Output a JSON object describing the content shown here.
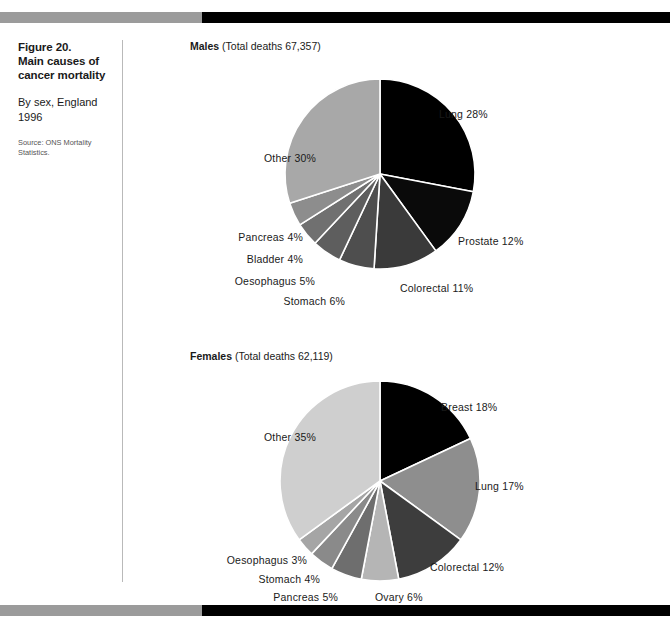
{
  "figure": {
    "title": "Figure 20.\nMain causes of\ncancer mortality",
    "title_line1": "Figure 20.",
    "title_line2": "Main causes of",
    "title_line3": "cancer mortality",
    "subtitle": "By sex, England 1996",
    "source": "Source: ONS Mortality Statistics."
  },
  "rules": {
    "gray": "#9b9b9b",
    "black": "#000000"
  },
  "chart_data": [
    {
      "type": "pie",
      "id": "males",
      "title": "Males",
      "subtitle": "(Total deaths 67,357)",
      "total_deaths": "67,357",
      "unit": "%",
      "start_angle_deg": 0,
      "direction": "clockwise",
      "categories": [
        "Lung",
        "Prostate",
        "Colorectal",
        "Stomach",
        "Oesophagus",
        "Bladder",
        "Pancreas",
        "Other"
      ],
      "values": [
        28,
        12,
        11,
        6,
        5,
        4,
        4,
        30
      ],
      "labels": [
        "Lung  28%",
        "Prostate  12%",
        "Colorectal  11%",
        "Stomach  6%",
        "Oesophagus  5%",
        "Bladder  4%",
        "Pancreas  4%",
        "Other  30%"
      ],
      "colors": [
        "#000000",
        "#0a0a0a",
        "#3a3a3a",
        "#4e4e4e",
        "#5e5e5e",
        "#707070",
        "#8d8d8d",
        "#a8a8a8"
      ]
    },
    {
      "type": "pie",
      "id": "females",
      "title": "Females",
      "subtitle": "(Total deaths 62,119)",
      "total_deaths": "62,119",
      "unit": "%",
      "start_angle_deg": 0,
      "direction": "clockwise",
      "categories": [
        "Breast",
        "Lung",
        "Colorectal",
        "Ovary",
        "Pancreas",
        "Stomach",
        "Oesophagus",
        "Other"
      ],
      "values": [
        18,
        17,
        12,
        6,
        5,
        4,
        3,
        35
      ],
      "labels": [
        "Breast  18%",
        "Lung  17%",
        "Colorectal  12%",
        "Ovary  6%",
        "Pancreas  5%",
        "Stomach  4%",
        "Oesophagus  3%",
        "Other  35%"
      ],
      "colors": [
        "#000000",
        "#8e8e8e",
        "#3d3d3d",
        "#b5b5b5",
        "#6e6e6e",
        "#8a8a8a",
        "#a5a5a5",
        "#cfcfcf"
      ]
    }
  ],
  "males_labels": {
    "lung": "Lung  28%",
    "prostate": "Prostate  12%",
    "colorectal": "Colorectal  11%",
    "stomach": "Stomach  6%",
    "oesophagus": "Oesophagus  5%",
    "bladder": "Bladder  4%",
    "pancreas": "Pancreas  4%",
    "other": "Other  30%"
  },
  "females_labels": {
    "breast": "Breast  18%",
    "lung": "Lung  17%",
    "colorectal": "Colorectal  12%",
    "ovary": "Ovary  6%",
    "pancreas": "Pancreas  5%",
    "stomach": "Stomach  4%",
    "oesophagus": "Oesophagus  3%",
    "other": "Other  35%"
  },
  "headings": {
    "males_sex": "Males",
    "males_total": " (Total deaths 67,357)",
    "females_sex": "Females",
    "females_total": " (Total deaths 62,119)"
  }
}
